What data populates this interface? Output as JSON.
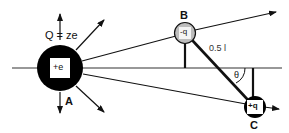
{
  "diagram": {
    "type": "physics-charge-diagram",
    "charges": [
      {
        "id": "A",
        "label": "A",
        "inner_label": "+e",
        "total_charge_label": "Q = ze",
        "fill": "#000000"
      },
      {
        "id": "B",
        "label": "B",
        "inner_label": "-q",
        "fill": "#bdbdbd"
      },
      {
        "id": "C",
        "label": "C",
        "inner_label": "+q",
        "fill": "#000000"
      }
    ],
    "rod_length_label": "0.5  l",
    "angle_label": "θ"
  },
  "colors": {
    "line": "#111111",
    "charge_dark": "#000000",
    "charge_light": "#bdbdbd",
    "inner_box": "#ffffff"
  }
}
